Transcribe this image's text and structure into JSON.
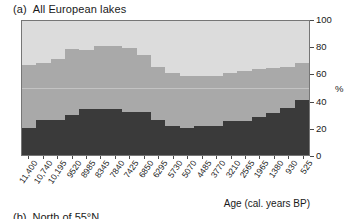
{
  "panel": {
    "tag": "(a)",
    "title": "All European lakes"
  },
  "next_panel": {
    "tag": "(b)",
    "title": "North of 55°N"
  },
  "axes": {
    "x_title": "Age (cal. years BP)",
    "y_unit": "%"
  },
  "chart_data": {
    "type": "bar",
    "stacked": true,
    "xlabel": "Age (cal. years BP)",
    "ylabel": "%",
    "ylim": [
      0,
      100
    ],
    "yticks": [
      0,
      20,
      40,
      60,
      80,
      100
    ],
    "grid": false,
    "legend": null,
    "categories": [
      "11,400",
      "10,740",
      "10,195",
      "9520",
      "8985",
      "8345",
      "7840",
      "7425",
      "6850",
      "6295",
      "5730",
      "5070",
      "4485",
      "3770",
      "3210",
      "2565",
      "1965",
      "1380",
      "930",
      "525"
    ],
    "series": [
      {
        "name": "lower-band",
        "color": "#3a3a3a",
        "values": [
          20,
          26,
          26,
          30,
          34,
          34,
          34,
          32,
          32,
          26,
          22,
          20,
          22,
          22,
          25,
          25,
          28,
          31,
          35,
          41
        ]
      },
      {
        "name": "middle-band",
        "color": "#a9a9a9",
        "values": [
          47,
          43,
          46,
          49,
          44,
          47,
          47,
          48,
          43,
          40,
          39,
          39,
          37,
          37,
          36,
          38,
          36,
          34,
          31,
          28
        ]
      },
      {
        "name": "upper-band",
        "color": "#dcdcdc",
        "values": [
          33,
          31,
          28,
          21,
          22,
          19,
          19,
          20,
          25,
          34,
          39,
          41,
          41,
          41,
          39,
          37,
          36,
          35,
          34,
          31
        ]
      }
    ]
  }
}
